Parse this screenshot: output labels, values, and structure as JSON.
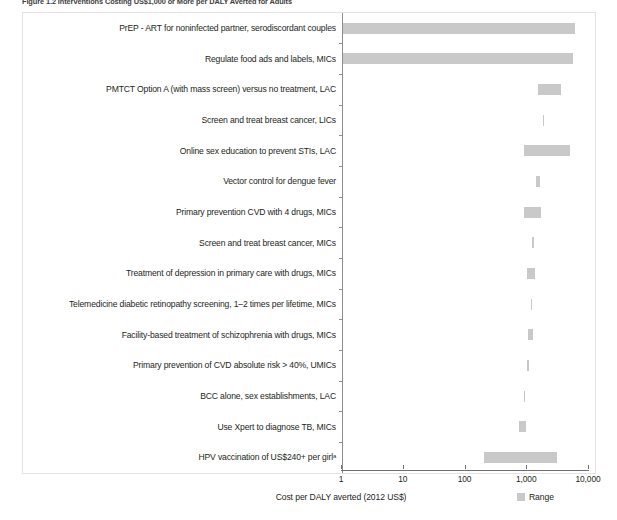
{
  "figure": {
    "caption": "Figure 1.2  Interventions Costing US$1,000 or More per DALY Averted for Adults"
  },
  "axis": {
    "x_title": "Cost per DALY averted (2012 US$)",
    "tick_labels": [
      "1",
      "10",
      "100",
      "1,000",
      "10,000"
    ],
    "tick_values": [
      1,
      10,
      100,
      1000,
      10000
    ]
  },
  "legend": {
    "swatch_color": "#c9c9c9",
    "label": "Range"
  },
  "colors": {
    "bar": "#c9c9c9",
    "axis": "#6f6f6f",
    "frame": "#e3e3e3",
    "text": "#231f20"
  },
  "chart_data": {
    "type": "bar",
    "orientation": "horizontal",
    "subtype": "range",
    "title": "Figure 1.2  Interventions Costing US$1,000 or More per DALY Averted for Adults",
    "xlabel": "Cost per DALY averted (2012 US$)",
    "ylabel": "",
    "xscale": "log",
    "xlim": [
      1,
      10000
    ],
    "xticks": [
      1,
      10,
      100,
      1000,
      10000
    ],
    "xticklabels": [
      "1",
      "10",
      "100",
      "1,000",
      "10,000"
    ],
    "grid": false,
    "legend": [
      "Range"
    ],
    "legend_position": "bottom-right",
    "categories": [
      "PrEP - ART for noninfected partner, serodiscordant couples",
      "Regulate food ads and labels, MICs",
      "PMTCT Option A (with mass screen) versus no treatment, LAC",
      "Screen and treat breast cancer, LICs",
      "Online sex education to prevent STIs, LAC",
      "Vector control for dengue fever",
      "Primary prevention CVD with 4 drugs, MICs",
      "Screen and treat breast cancer, MICs",
      "Treatment of depression in primary care with drugs, MICs",
      "Telemedicine diabetic retinopathy screening, 1–2 times per lifetime, MICs",
      "Facility-based treatment of schizophrenia with drugs, MICs",
      "Primary prevention of CVD absolute risk > 40%, UMICs",
      "BCC alone, sex establishments, LAC",
      "Use Xpert to diagnose TB, MICs",
      "HPV vaccination of US$240+ per girlᵃ"
    ],
    "ranges": [
      {
        "low": 1,
        "high": 6000
      },
      {
        "low": 1,
        "high": 5500
      },
      {
        "low": 1500,
        "high": 3500
      },
      {
        "low": 1800,
        "high": 1850
      },
      {
        "low": 900,
        "high": 5000
      },
      {
        "low": 1400,
        "high": 1600
      },
      {
        "low": 900,
        "high": 1700
      },
      {
        "low": 1200,
        "high": 1250
      },
      {
        "low": 1000,
        "high": 1320
      },
      {
        "low": 1130,
        "high": 1180
      },
      {
        "low": 1040,
        "high": 1250
      },
      {
        "low": 1000,
        "high": 1040
      },
      {
        "low": 880,
        "high": 920
      },
      {
        "low": 740,
        "high": 960
      },
      {
        "low": 200,
        "high": 3000
      }
    ]
  }
}
